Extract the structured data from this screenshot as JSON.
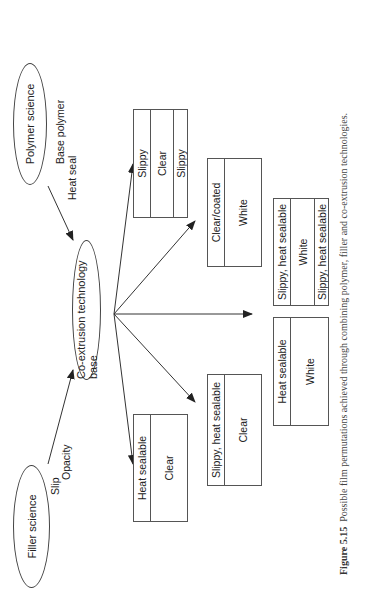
{
  "diagram": {
    "nodes": {
      "polymer_science": "Polymer science",
      "filler_science": "Filler science",
      "coextrusion_base": "Co-extrusion technology base"
    },
    "edge_labels": {
      "polymer": [
        "Base polymer",
        "Heat seal"
      ],
      "filler": [
        "Slip",
        "Opacity"
      ]
    },
    "films": [
      {
        "layers": [
          "Slippy",
          "Clear",
          "Slippy"
        ]
      },
      {
        "layers": [
          "Clear/coated",
          "White"
        ]
      },
      {
        "layers": [
          "Slippy, heat sealable",
          "White",
          "Slippy, heat sealable"
        ]
      },
      {
        "layers": [
          "Heat sealable",
          "White"
        ]
      },
      {
        "layers": [
          "Slippy, heat sealable",
          "Clear"
        ]
      },
      {
        "layers": [
          "Heat sealable",
          "Clear"
        ]
      }
    ]
  },
  "caption": {
    "label": "Figure 5.15",
    "text": "Possible film permutations achieved through combining polymer, filler and co-extrusion technologies."
  }
}
